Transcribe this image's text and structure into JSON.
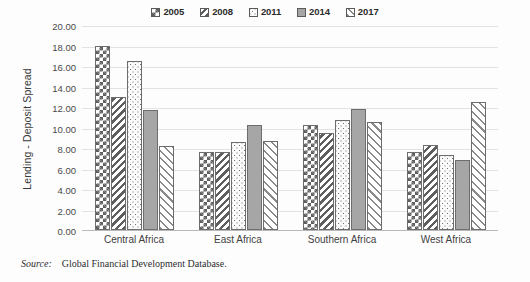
{
  "chart_data": {
    "type": "bar",
    "title": "",
    "xlabel": "",
    "ylabel": "Lending - Deposit Spread",
    "ylim": [
      0,
      20
    ],
    "ytick_step": 2,
    "ytick_labels": [
      "20.00",
      "18.00",
      "16.00",
      "14.00",
      "12.00",
      "10.00",
      "8.00",
      "6.00",
      "4.00",
      "2.00",
      "0.00"
    ],
    "ytick_values": [
      20,
      18,
      16,
      14,
      12,
      10,
      8,
      6,
      4,
      2,
      0
    ],
    "grid": true,
    "legend_position": "top-center",
    "categories": [
      "Central Africa",
      "East Africa",
      "Southern Africa",
      "West Africa"
    ],
    "series": [
      {
        "name": "2005",
        "pattern": "checker",
        "values": [
          18.0,
          7.6,
          10.2,
          7.6
        ]
      },
      {
        "name": "2008",
        "pattern": "diag-dense",
        "values": [
          13.0,
          7.6,
          9.5,
          8.3
        ]
      },
      {
        "name": "2011",
        "pattern": "dots",
        "values": [
          16.5,
          8.6,
          10.7,
          7.3
        ]
      },
      {
        "name": "2014",
        "pattern": "solid",
        "values": [
          11.7,
          10.2,
          11.8,
          6.8
        ]
      },
      {
        "name": "2017",
        "pattern": "diag-light",
        "values": [
          8.2,
          8.7,
          10.5,
          12.5
        ]
      }
    ]
  },
  "legend": {
    "entries": [
      {
        "label": "2005"
      },
      {
        "label": "2008"
      },
      {
        "label": "2011"
      },
      {
        "label": "2014"
      },
      {
        "label": "2017"
      }
    ]
  },
  "source": {
    "label": "Source:",
    "text": "Global Financial Development Database."
  },
  "colors": {
    "bar_outline": "#6d6d6d",
    "pattern_ink": "#5e5e5e",
    "solid_fill": "#a6a6a6",
    "gridline": "#e2e2e2",
    "axis": "#b9b9b9",
    "text": "#3a3a3a",
    "background": "#fdfdfd"
  }
}
